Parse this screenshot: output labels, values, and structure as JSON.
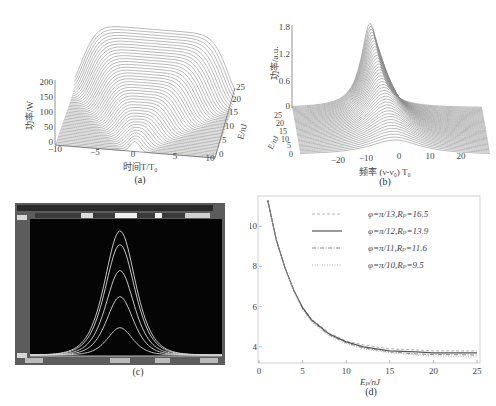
{
  "figure": {
    "panels": [
      {
        "id": "a",
        "caption": "(a)"
      },
      {
        "id": "b",
        "caption": "(b)"
      },
      {
        "id": "c",
        "caption": "(c)"
      },
      {
        "id": "d",
        "caption": "(d)"
      }
    ]
  },
  "panel_a": {
    "ylabel": "功率/W",
    "xlabel": "时间T/T₀",
    "zlabel": "E/nJ",
    "yticks": [
      "0",
      "50",
      "100",
      "150",
      "200"
    ],
    "xticks": [
      "−10",
      "−5",
      "0",
      "5",
      "10"
    ],
    "zticks": [
      "0",
      "5",
      "10",
      "15",
      "20",
      "25"
    ],
    "caption": "(a)"
  },
  "panel_b": {
    "ylabel": "功率/a.u.",
    "xlabel": "频率 (ν-ν₀) T₀",
    "zlabel": "E/nJ",
    "yticks": [
      "0",
      "0.6",
      "1.2",
      "1.8"
    ],
    "xticks": [
      "−20",
      "−10",
      "0",
      "10",
      "20"
    ],
    "zticks": [
      "0",
      "5",
      "10",
      "15",
      "20",
      "25"
    ],
    "caption": "(b)"
  },
  "panel_c": {
    "caption": "(c)",
    "display_bg": "#050505",
    "trace_color": "#d8d8d8"
  },
  "panel_d": {
    "ylabel": "S,Δν/THz",
    "xlabel": "Eₚ/nJ",
    "caption": "(d)",
    "legend": [
      {
        "label": "φ=π/13,Rₚ=16.5",
        "style": "dashed"
      },
      {
        "label": "φ=π/12,Rₚ=13.9",
        "style": "solid"
      },
      {
        "label": "φ=π/11,Rₚ=11.6",
        "style": "dashdot"
      },
      {
        "label": "φ=π/10,Rₚ=9.5",
        "style": "dotted"
      }
    ]
  },
  "chart_data": [
    {
      "type": "surface3d",
      "title": "(a)",
      "xlabel": "时间T/T₀",
      "ylabel": "功率/W",
      "zlabel": "E/nJ",
      "xlim": [
        -10,
        10
      ],
      "ylim": [
        0,
        200
      ],
      "zlim": [
        0,
        25
      ],
      "xticks": [
        -10,
        -5,
        0,
        5,
        10
      ],
      "yticks": [
        0,
        50,
        100,
        150,
        200
      ],
      "zticks": [
        0,
        5,
        10,
        15,
        20,
        25
      ],
      "description": "Temporal pulse power vs time for pulse energies 0–25 nJ; pulse broadens with energy into a flat-top shape reaching ~200 W"
    },
    {
      "type": "surface3d",
      "title": "(b)",
      "xlabel": "频率 (ν-ν₀) T₀",
      "ylabel": "功率/a.u.",
      "zlabel": "E/nJ",
      "xlim": [
        -25,
        25
      ],
      "ylim": [
        0,
        1.8
      ],
      "zlim": [
        0,
        25
      ],
      "xticks": [
        -20,
        -10,
        0,
        10,
        20
      ],
      "yticks": [
        0,
        0.6,
        1.2,
        1.8
      ],
      "zticks": [
        0,
        5,
        10,
        15,
        20,
        25
      ],
      "description": "Spectral power vs frequency for energies 0–25 nJ; spectrum narrows into a peak near -5 reaching ~1.8 a.u."
    },
    {
      "type": "line",
      "title": "(c)",
      "description": "Oscilloscope/OSA screenshot with 5 nested bell-shaped traces of increasing peak height",
      "series": [
        {
          "name": "trace1",
          "relative_peak": 0.22
        },
        {
          "name": "trace2",
          "relative_peak": 0.47
        },
        {
          "name": "trace3",
          "relative_peak": 0.68
        },
        {
          "name": "trace4",
          "relative_peak": 0.89
        },
        {
          "name": "trace5",
          "relative_peak": 1.0
        }
      ]
    },
    {
      "type": "line",
      "title": "(d)",
      "xlabel": "Eₚ/nJ",
      "ylabel": "S,Δν/THz",
      "xlim": [
        0,
        25
      ],
      "ylim": [
        3.2,
        11.5
      ],
      "xticks": [
        0,
        5,
        10,
        15,
        20,
        25
      ],
      "yticks": [
        4,
        6,
        8,
        10
      ],
      "legend_position": "upper right",
      "x": [
        1,
        2,
        3,
        4,
        5,
        6,
        8,
        10,
        12,
        15,
        18,
        20,
        25
      ],
      "series": [
        {
          "name": "φ=π/13,Rₚ=16.5",
          "values": [
            11.3,
            9.3,
            7.9,
            6.8,
            6.0,
            5.4,
            4.7,
            4.3,
            4.1,
            3.9,
            3.85,
            3.8,
            3.8
          ]
        },
        {
          "name": "φ=π/12,Rₚ=13.9",
          "values": [
            11.3,
            9.3,
            7.9,
            6.8,
            5.95,
            5.35,
            4.65,
            4.25,
            4.0,
            3.8,
            3.75,
            3.7,
            3.7
          ]
        },
        {
          "name": "φ=π/11,Rₚ=11.6",
          "values": [
            11.3,
            9.3,
            7.9,
            6.8,
            5.9,
            5.3,
            4.6,
            4.2,
            3.95,
            3.75,
            3.65,
            3.62,
            3.6
          ]
        },
        {
          "name": "φ=π/10,Rₚ=9.5",
          "values": [
            11.3,
            9.3,
            7.9,
            6.75,
            5.85,
            5.25,
            4.55,
            4.15,
            3.9,
            3.7,
            3.6,
            3.55,
            3.5
          ]
        }
      ]
    }
  ]
}
